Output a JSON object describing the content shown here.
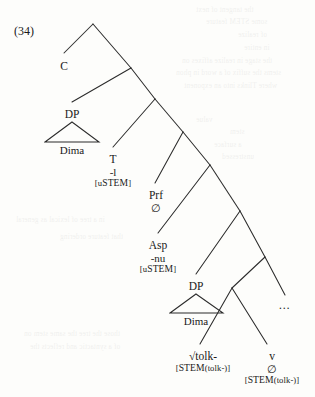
{
  "figure": {
    "example_number": "(34)",
    "type": "syntax-tree"
  },
  "nodes": {
    "c": {
      "label": "C"
    },
    "dp_spec": {
      "label": "DP",
      "terminal": "Dima"
    },
    "t": {
      "label": "T",
      "exponent": "-l",
      "feature_open": "[",
      "feature_u": "u",
      "feature_stem": "STEM",
      "feature_close": "]"
    },
    "prf": {
      "label": "Prf",
      "exponent": "∅"
    },
    "asp": {
      "label": "Asp",
      "exponent": "-nu",
      "feature_open": "[",
      "feature_u": "u",
      "feature_stem": "STEM",
      "feature_close": "]"
    },
    "dp_obj": {
      "label": "DP",
      "terminal": "Dima"
    },
    "root": {
      "label": "√tolk-",
      "feature_open": "[",
      "feature_stem": "STEM",
      "feature_arg": "(tolk-)",
      "feature_close": "]"
    },
    "v": {
      "label": "v",
      "exponent": "∅",
      "feature_open": "[",
      "feature_stem": "STEM",
      "feature_arg": "(tolk-)",
      "feature_close": "]"
    },
    "ellipsis": {
      "label": "…"
    }
  },
  "ghost_text": [
    {
      "text": "the tangent of next",
      "x": 196,
      "y": 6
    },
    {
      "text": "some STEM feature",
      "x": 206,
      "y": 18
    },
    {
      "text": "of realize",
      "x": 238,
      "y": 31
    },
    {
      "text": "in entire",
      "x": 244,
      "y": 44
    },
    {
      "text": "the stage in realize affixes on",
      "x": 182,
      "y": 57
    },
    {
      "text": "stems the suffix of a word in phon",
      "x": 176,
      "y": 69
    },
    {
      "text": "where Tlinks into an exponent",
      "x": 184,
      "y": 82
    },
    {
      "text": "value",
      "x": 196,
      "y": 116
    },
    {
      "text": "stem",
      "x": 230,
      "y": 128
    },
    {
      "text": "a surface",
      "x": 214,
      "y": 141
    },
    {
      "text": "unstressed",
      "x": 222,
      "y": 153
    },
    {
      "text": "in a tree of lexical as general",
      "x": 16,
      "y": 216
    },
    {
      "text": "that feature ordering",
      "x": 60,
      "y": 233
    },
    {
      "text": "those the tree the same stem on",
      "x": 24,
      "y": 330
    },
    {
      "text": "of a syntactic and reflects the",
      "x": 30,
      "y": 343
    }
  ]
}
